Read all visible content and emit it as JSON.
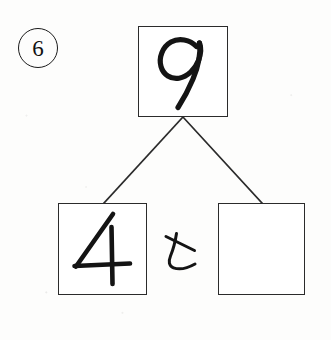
{
  "worksheet": {
    "title": "Number bond decomposition exercise",
    "language": "ja",
    "question_number": "6",
    "question_number_style": "circled",
    "background_color": "#fdfdfc",
    "ink_color": "#141414",
    "line_color": "#2b2b2b"
  },
  "bond": {
    "total_box": {
      "label": "total-box",
      "value": "9",
      "filled": true,
      "handwritten": true
    },
    "left_part_box": {
      "label": "left-part-box",
      "value": "4",
      "filled": true,
      "handwritten": true
    },
    "right_part_box": {
      "label": "right-part-box",
      "value": "",
      "filled": false,
      "handwritten": false,
      "placeholder": ""
    },
    "conjunction": {
      "text": "と",
      "romaji": "to",
      "meaning": "and",
      "handwritten": true
    },
    "connector_left": "line-from-total-to-left-part",
    "connector_right": "line-from-total-to-right-part"
  },
  "icons": {
    "circle_number": "circled-number-icon",
    "branch": "branch-connector-icon"
  }
}
